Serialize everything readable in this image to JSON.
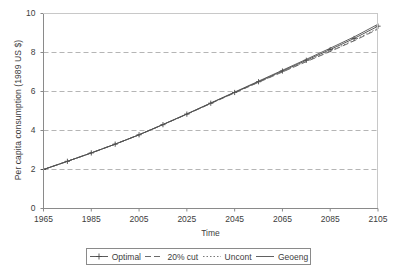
{
  "chart_data": {
    "type": "line",
    "title": "",
    "xlabel": "Time",
    "ylabel": "Per capita consumption (1989 US $)",
    "xlim": [
      1965,
      2105
    ],
    "ylim": [
      0,
      10
    ],
    "xticks": [
      "1965",
      "1985",
      "2005",
      "2025",
      "2045",
      "2065",
      "2085",
      "2105"
    ],
    "yticks": [
      "0",
      "2",
      "4",
      "6",
      "8",
      "10"
    ],
    "grid": "horizontal-dashed",
    "legend_position": "below-axes",
    "x": [
      1965,
      1975,
      1985,
      1995,
      2005,
      2015,
      2025,
      2035,
      2045,
      2055,
      2065,
      2075,
      2085,
      2095,
      2105
    ],
    "series": [
      {
        "name": "Optimal",
        "style": "solid-plus-markers",
        "color": "#4a4a4a",
        "values": [
          2.0,
          2.42,
          2.85,
          3.3,
          3.78,
          4.3,
          4.84,
          5.4,
          5.95,
          6.5,
          7.05,
          7.6,
          8.15,
          8.72,
          9.35
        ]
      },
      {
        "name": "20% cut",
        "style": "dashed",
        "color": "#5a5a5a",
        "values": [
          2.0,
          2.42,
          2.85,
          3.3,
          3.78,
          4.3,
          4.83,
          5.38,
          5.93,
          6.47,
          7.0,
          7.53,
          8.05,
          8.6,
          9.2
        ]
      },
      {
        "name": "Uncont",
        "style": "dotted",
        "color": "#6a6a6a",
        "values": [
          2.0,
          2.42,
          2.85,
          3.3,
          3.78,
          4.3,
          4.84,
          5.39,
          5.94,
          6.48,
          7.02,
          7.55,
          8.08,
          8.63,
          9.25
        ]
      },
      {
        "name": "Geoeng",
        "style": "solid",
        "color": "#4f4f4f",
        "values": [
          2.0,
          2.42,
          2.85,
          3.3,
          3.78,
          4.31,
          4.85,
          5.41,
          5.97,
          6.53,
          7.09,
          7.65,
          8.22,
          8.8,
          9.45
        ]
      }
    ]
  },
  "axis": {
    "yticks": [
      {
        "label": "10",
        "value": 10
      },
      {
        "label": "8",
        "value": 8
      },
      {
        "label": "6",
        "value": 6
      },
      {
        "label": "4",
        "value": 4
      },
      {
        "label": "2",
        "value": 2
      },
      {
        "label": "0",
        "value": 0
      }
    ],
    "xticks": [
      {
        "label": "1965",
        "value": 1965
      },
      {
        "label": "1985",
        "value": 1985
      },
      {
        "label": "2005",
        "value": 2005
      },
      {
        "label": "2025",
        "value": 2025
      },
      {
        "label": "2045",
        "value": 2045
      },
      {
        "label": "2065",
        "value": 2065
      },
      {
        "label": "2085",
        "value": 2085
      },
      {
        "label": "2105",
        "value": 2105
      }
    ]
  },
  "legend": {
    "entries": [
      {
        "label": "Optimal",
        "marker": "line-plus-marker"
      },
      {
        "label": "20% cut",
        "marker": "dashed-line"
      },
      {
        "label": "Uncont",
        "marker": "dotted-line"
      },
      {
        "label": "Geoeng",
        "marker": "solid-line"
      }
    ]
  }
}
